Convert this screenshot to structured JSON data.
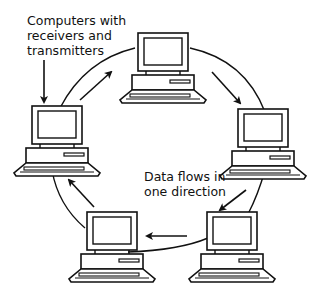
{
  "diagram": {
    "type": "ring-network",
    "labels": {
      "computers_line1": "Computers with",
      "computers_line2": "receivers and",
      "computers_line3": "transmitters",
      "flow_line1": "Data flows in",
      "flow_line2": "one direction"
    },
    "nodes": [
      {
        "id": "top",
        "label": "computer"
      },
      {
        "id": "right",
        "label": "computer"
      },
      {
        "id": "bottom-right",
        "label": "computer"
      },
      {
        "id": "bottom-left",
        "label": "computer"
      },
      {
        "id": "left",
        "label": "computer"
      }
    ],
    "flow_direction": "clockwise",
    "colors": {
      "stroke": "#111111",
      "background": "#ffffff"
    }
  }
}
